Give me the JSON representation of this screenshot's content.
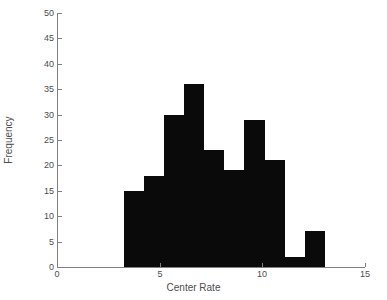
{
  "chart_data": {
    "type": "bar",
    "title": "",
    "xlabel": "Center Rate",
    "ylabel": "Frequency",
    "xlim": [
      0,
      15
    ],
    "ylim": [
      0,
      50
    ],
    "xticks": [
      0,
      5,
      10,
      15
    ],
    "yticks": [
      0,
      5,
      10,
      15,
      20,
      25,
      30,
      35,
      40,
      45,
      50
    ],
    "xtick_labels": [
      "0",
      "5",
      "10",
      "15"
    ],
    "ytick_labels": [
      "0",
      "5",
      "10",
      "15",
      "20",
      "25",
      "30",
      "35",
      "40",
      "45",
      "50"
    ],
    "grid": false,
    "legend": null,
    "bar_color": "#0a0a0a",
    "axis_color": "#808080",
    "text_color": "#4d4d4d",
    "background": "#ffffff",
    "bin_width": 0.98,
    "bin_edges": [
      3.25,
      4.23,
      5.21,
      6.19,
      7.17,
      8.15,
      9.13,
      10.11,
      11.09,
      12.07,
      13.05
    ],
    "bin_centers": [
      3.74,
      4.72,
      5.7,
      6.68,
      7.66,
      8.64,
      9.62,
      10.6,
      11.58,
      12.56
    ],
    "categories": [
      "3.25-4.23",
      "4.23-5.21",
      "5.21-6.19",
      "6.19-7.17",
      "7.17-8.15",
      "8.15-9.13",
      "9.13-10.11",
      "10.11-11.09",
      "11.09-12.07",
      "12.07-13.05"
    ],
    "values": [
      15,
      18,
      30,
      36,
      23,
      19,
      29,
      21,
      2,
      7
    ]
  }
}
